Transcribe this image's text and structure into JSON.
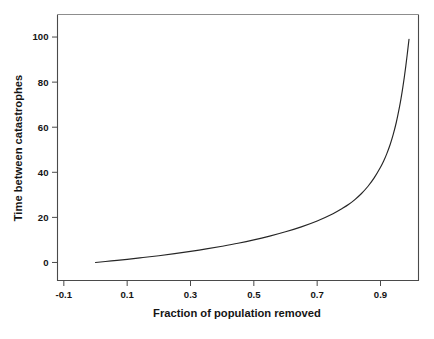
{
  "figure": {
    "background_color": "#ffffff",
    "line_color": "#262626",
    "frame_color": "#4a4a4a"
  },
  "chart_data": {
    "type": "line",
    "title": "",
    "xlabel": "Fraction of population removed",
    "ylabel": "Time between catastrophes",
    "xlim": [
      -0.12,
      1.02
    ],
    "ylim": [
      -8,
      110
    ],
    "grid": false,
    "legend": false,
    "xticks": [
      -0.1,
      0.1,
      0.3,
      0.5,
      0.7,
      0.9
    ],
    "xtick_labels": [
      "-0.1",
      "0.1",
      "0.3",
      "0.5",
      "0.7",
      "0.9"
    ],
    "yticks": [
      0,
      20,
      40,
      60,
      80,
      100
    ],
    "ytick_labels": [
      "0",
      "20",
      "40",
      "60",
      "80",
      "100"
    ],
    "series": [
      {
        "name": "Time between catastrophes",
        "x": [
          0.0,
          0.05,
          0.1,
          0.15,
          0.2,
          0.25,
          0.3,
          0.35,
          0.4,
          0.45,
          0.5,
          0.55,
          0.6,
          0.65,
          0.7,
          0.75,
          0.78,
          0.8,
          0.82,
          0.84,
          0.86,
          0.88,
          0.9,
          0.91,
          0.92,
          0.93,
          0.94,
          0.95,
          0.96,
          0.965,
          0.97,
          0.975,
          0.98,
          0.985,
          0.99
        ],
        "values": [
          0.0,
          0.7,
          1.4,
          2.2,
          3.0,
          3.9,
          4.9,
          6.0,
          7.2,
          8.5,
          10.0,
          11.7,
          13.6,
          15.8,
          18.4,
          21.6,
          24.0,
          25.8,
          28.0,
          30.6,
          33.7,
          37.5,
          42.2,
          45.0,
          48.3,
          52.1,
          56.7,
          62.2,
          69.0,
          72.9,
          77.2,
          82.0,
          87.2,
          93.0,
          99.0
        ]
      }
    ]
  },
  "axis_labels": {
    "x_title": "Fraction of population removed",
    "y_title": "Time between catastrophes"
  },
  "caption": {
    "cropped_text": ""
  }
}
